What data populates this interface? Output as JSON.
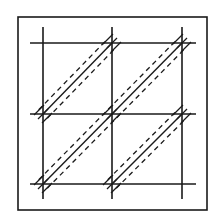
{
  "diagram": {
    "width": 217,
    "height": 217,
    "colors": {
      "stroke": "#1a1a1a",
      "background": "#ffffff"
    },
    "frame": {
      "x": 18,
      "y": 17,
      "w": 189,
      "h": 193
    },
    "grid": {
      "verticals": [
        {
          "x": 43,
          "y1": 27,
          "y2": 199
        },
        {
          "x": 112,
          "y1": 27,
          "y2": 199
        },
        {
          "x": 182,
          "y1": 27,
          "y2": 199
        }
      ],
      "horizontals": [
        {
          "y": 43,
          "x1": 30,
          "x2": 196
        },
        {
          "y": 114,
          "x1": 30,
          "x2": 196
        },
        {
          "y": 184,
          "x1": 30,
          "x2": 196
        }
      ]
    },
    "diagonals": [
      {
        "x1": 43,
        "y1": 114,
        "x2": 112,
        "y2": 43
      },
      {
        "x1": 43,
        "y1": 184,
        "x2": 182,
        "y2": 43
      },
      {
        "x1": 112,
        "y1": 184,
        "x2": 182,
        "y2": 114
      }
    ],
    "dash_offset": 6,
    "hatch_points": [
      {
        "x": 43,
        "y": 114
      },
      {
        "x": 112,
        "y": 43
      },
      {
        "x": 43,
        "y": 184
      },
      {
        "x": 182,
        "y": 43
      },
      {
        "x": 112,
        "y": 184
      },
      {
        "x": 182,
        "y": 114
      },
      {
        "x": 112,
        "y": 114
      }
    ]
  }
}
